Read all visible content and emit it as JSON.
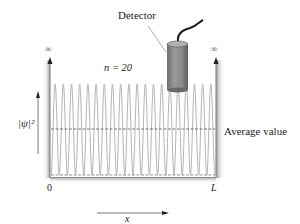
{
  "figure": {
    "detector_label": "Detector",
    "quantum_number_label": "n = 20",
    "average_label": "Average value",
    "y_axis_label": "|ψ|²",
    "x_axis_label": "x",
    "left_wall_label": "0",
    "right_wall_label": "L",
    "infinity_left": "∞",
    "infinity_right": "∞"
  },
  "chart_data": {
    "type": "line",
    "title": "",
    "xlabel": "x",
    "ylabel": "|ψ|²",
    "n": 20,
    "x_ticks": [
      "0",
      "L"
    ],
    "peak_count": 20,
    "average_value_fraction_of_peak": 0.5,
    "annotations": [
      "Detector",
      "n = 20",
      "Average value",
      "∞",
      "∞"
    ],
    "colors": {
      "curve": "#b8b8b8",
      "walls": "#9a9a9a",
      "dashed": "#555555",
      "detector_body": "#8a8a8a",
      "cable": "#1a1a1a"
    }
  }
}
